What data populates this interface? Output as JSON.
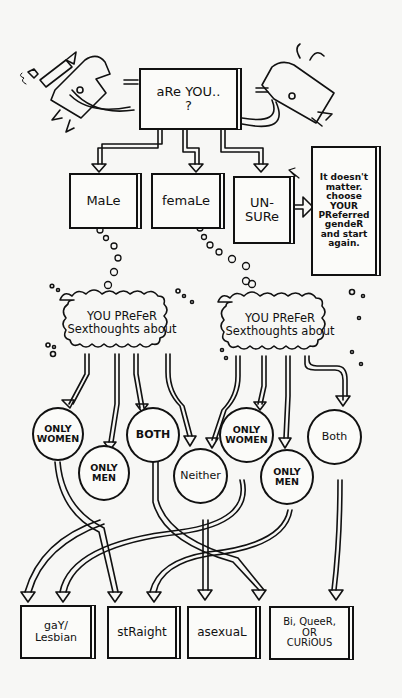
{
  "diagram": {
    "question": "aRe YOU..\n?",
    "gender_options": [
      {
        "label": "MaLe"
      },
      {
        "label": "femaLe"
      },
      {
        "label": "UN-\nSURe"
      }
    ],
    "unsure_note": "It doesn't\nmatter.\nchoose\nYOUR\nPReferred\ngendeR\nand start\nagain.",
    "clouds": [
      {
        "label": "YOU PReFeR\nSexthoughts about"
      },
      {
        "label": "YOU PReFeR\nSexthoughts about"
      }
    ],
    "preferences": [
      {
        "label": "ONLY\nWOMEN"
      },
      {
        "label": "ONLY\nMEN"
      },
      {
        "label": "BOTH"
      },
      {
        "label": "Neither"
      },
      {
        "label": "ONLY\nWOMEN"
      },
      {
        "label": "ONLY\nMEN"
      },
      {
        "label": "Both"
      }
    ],
    "outcomes": [
      {
        "label": "gaY/\nLesbian"
      },
      {
        "label": "stRaight"
      },
      {
        "label": "asexuaL"
      },
      {
        "label": "Bi, QueeR,\nOR\nCURiOUS"
      }
    ]
  },
  "colors": {
    "ink": "#111111",
    "paper": "#f7f7f5"
  }
}
